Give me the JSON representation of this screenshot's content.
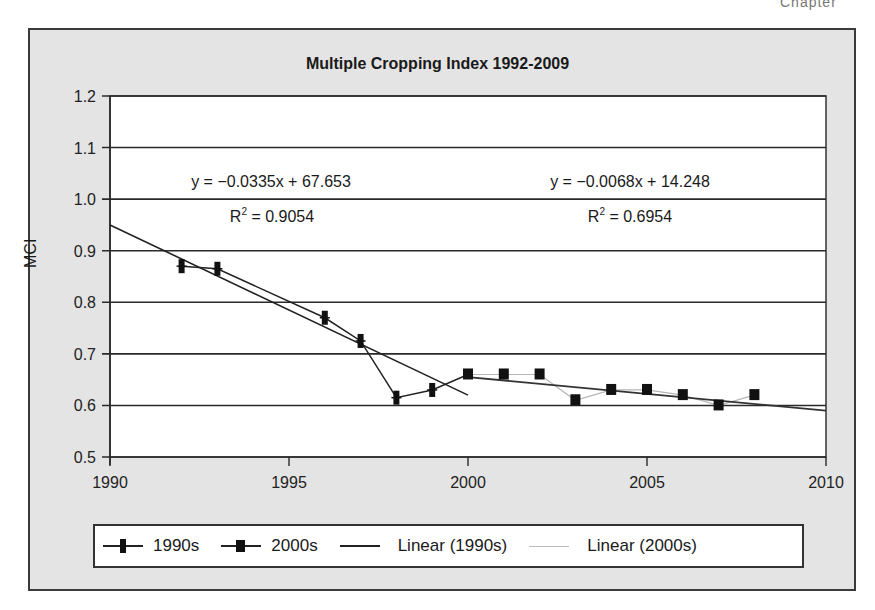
{
  "corner_fragment": "Chapter",
  "chart_data": {
    "type": "line",
    "title": "Multiple Cropping Index 1992-2009",
    "xlabel": "",
    "ylabel": "MCI",
    "xlim": [
      1990,
      2010
    ],
    "ylim": [
      0.5,
      1.2
    ],
    "x_ticks": [
      "1990",
      "1995",
      "2000",
      "2005",
      "2010"
    ],
    "y_ticks": [
      "0.5",
      "0.6",
      "0.7",
      "0.8",
      "0.9",
      "1.0",
      "1.1",
      "1.2"
    ],
    "grid": "horizontal",
    "legend_position": "bottom",
    "series": [
      {
        "name": "1990s",
        "x": [
          1992,
          1993,
          1996,
          1997,
          1998,
          1999
        ],
        "values": [
          0.87,
          0.865,
          0.77,
          0.725,
          0.615,
          0.63
        ]
      },
      {
        "name": "2000s",
        "x": [
          2000,
          2001,
          2002,
          2003,
          2004,
          2005,
          2006,
          2007,
          2008
        ],
        "values": [
          0.66,
          0.66,
          0.66,
          0.61,
          0.63,
          0.63,
          0.62,
          0.6,
          0.62
        ]
      }
    ],
    "trendlines": [
      {
        "name": "Linear (1990s)",
        "equation": "y = −0.0335x + 67.653",
        "r2": "R² = 0.9054",
        "x": [
          1990,
          2000
        ],
        "values": [
          0.95,
          0.62
        ]
      },
      {
        "name": "Linear (2000s)",
        "equation": "y = −0.0068x + 14.248",
        "r2": "R² = 0.6954",
        "x": [
          2000,
          2010
        ],
        "values": [
          0.655,
          0.59
        ]
      }
    ],
    "annotations": [
      {
        "text": "y = −0.0335x + 67.653",
        "x": 1994,
        "y": 1.03
      },
      {
        "text": "R² = 0.9054",
        "x": 1994,
        "y": 0.99
      },
      {
        "text": "y = −0.0068x + 14.248",
        "x": 2004.5,
        "y": 1.03
      },
      {
        "text": "R² = 0.6954",
        "x": 2004.5,
        "y": 0.99
      }
    ]
  },
  "legend": {
    "items": [
      "1990s",
      "2000s",
      "Linear (1990s)",
      "Linear (2000s)"
    ]
  },
  "equations": {
    "left_eq": "y = −0.0335x + 67.653",
    "left_r2_prefix": "R",
    "left_r2_value": " = 0.9054",
    "right_eq": "y = −0.0068x + 14.248",
    "right_r2_prefix": "R",
    "right_r2_value": " = 0.6954"
  },
  "colors": {
    "frame_bg": "#e4e4e4",
    "plot_bg": "#ffffff",
    "series_dark": "#111111",
    "connector_light": "#b5b5b5"
  }
}
